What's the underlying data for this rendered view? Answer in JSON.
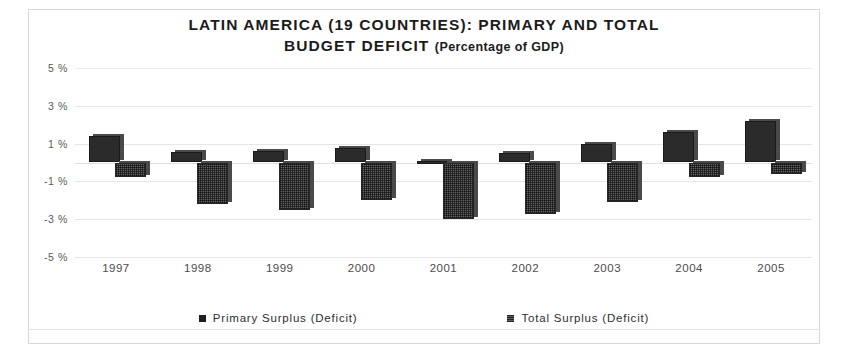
{
  "chart_data": {
    "type": "bar",
    "title": "LATIN AMERICA (19 COUNTRIES): PRIMARY AND TOTAL",
    "title_line2": "BUDGET DEFICIT",
    "subtitle": "(Percentage of GDP)",
    "xlabel": "",
    "ylabel": "",
    "ylim": [
      -5,
      5
    ],
    "yticks": [
      "5 %",
      "3 %",
      "1 %",
      "-1 %",
      "-3 %",
      "-5 %"
    ],
    "ytick_values": [
      5,
      3,
      1,
      -1,
      -3,
      -5
    ],
    "grid": true,
    "legend_position": "bottom",
    "categories": [
      "1997",
      "1998",
      "1999",
      "2000",
      "2001",
      "2002",
      "2003",
      "2004",
      "2005"
    ],
    "series": [
      {
        "name": "Primary Surplus (Deficit)",
        "color": "#2b2b2b",
        "values": [
          1.4,
          0.55,
          0.6,
          0.75,
          0.1,
          0.5,
          1.0,
          1.6,
          2.2
        ]
      },
      {
        "name": "Total Surplus (Deficit)",
        "color": "#636363",
        "values": [
          -0.75,
          -2.2,
          -2.5,
          -2.0,
          -3.0,
          -2.7,
          -2.1,
          -0.75,
          -0.6
        ]
      }
    ]
  },
  "legend": {
    "items": [
      {
        "label": "Primary Surplus (Deficit)",
        "swatch": "primary"
      },
      {
        "label": "Total Surplus (Deficit)",
        "swatch": "total"
      }
    ]
  }
}
